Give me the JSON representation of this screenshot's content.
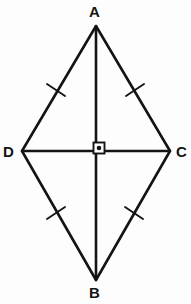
{
  "figure": {
    "kind": "rhombus-with-diagonals",
    "caption": "",
    "background_color": "#fdfdfd",
    "stroke_color": "#141414",
    "label_color": "#141414"
  },
  "vertices": [
    {
      "id": "A",
      "label": "A",
      "x": 96,
      "y": 26,
      "role": "top-apex"
    },
    {
      "id": "C",
      "label": "C",
      "x": 170,
      "y": 151,
      "role": "right-vertex"
    },
    {
      "id": "B",
      "label": "B",
      "x": 96,
      "y": 280,
      "role": "bottom-apex"
    },
    {
      "id": "D",
      "label": "D",
      "x": 22,
      "y": 151,
      "role": "left-vertex"
    }
  ],
  "sides": [
    {
      "id": "AD",
      "from": "A",
      "to": "D",
      "tick_count": 1,
      "tick_x": 56,
      "tick_y": 90
    },
    {
      "id": "AC",
      "from": "A",
      "to": "C",
      "tick_count": 1,
      "tick_x": 135,
      "tick_y": 90
    },
    {
      "id": "DB",
      "from": "D",
      "to": "B",
      "tick_count": 1,
      "tick_x": 56,
      "tick_y": 213
    },
    {
      "id": "CB",
      "from": "C",
      "to": "B",
      "tick_count": 1,
      "tick_x": 134,
      "tick_y": 213
    }
  ],
  "diagonals": [
    {
      "id": "AB",
      "from": "A",
      "to": "B",
      "orientation": "vertical",
      "x": 96,
      "y1": 26,
      "y2": 280
    },
    {
      "id": "DC",
      "from": "D",
      "to": "C",
      "orientation": "horizontal",
      "y": 151,
      "x1": 22,
      "x2": 170
    }
  ],
  "angle_markers": [
    {
      "id": "right-angle-center",
      "type": "right-angle-square-with-dot",
      "degrees": 90,
      "at_x": 99,
      "at_y": 147,
      "size": 11
    }
  ],
  "stroke_widths": {
    "side": 2.6,
    "diagonal": 2.6,
    "tick": 1.8,
    "marker": 1.8
  }
}
